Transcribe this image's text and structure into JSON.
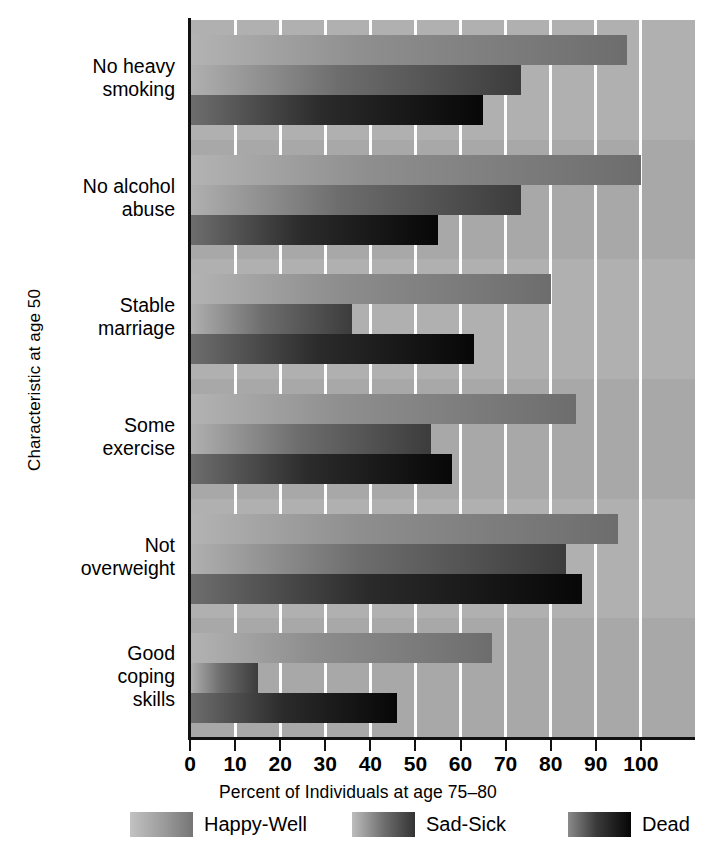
{
  "chart_data": {
    "type": "bar",
    "orientation": "horizontal",
    "title": "",
    "xlabel": "Percent of Individuals at age 75–80",
    "ylabel": "Characteristic at age 50",
    "categories": [
      "No heavy\nsmoking",
      "No alcohol\nabuse",
      "Stable\nmarriage",
      "Some\nexercise",
      "Not\noverweight",
      "Good\ncoping\nskills"
    ],
    "series": [
      {
        "name": "Happy-Well",
        "values": [
          97,
          100,
          80,
          85.5,
          95,
          67
        ]
      },
      {
        "name": "Sad-Sick",
        "values": [
          73.5,
          73.5,
          36,
          53.5,
          83.5,
          15
        ]
      },
      {
        "name": "Dead",
        "values": [
          65,
          55,
          63,
          58,
          87,
          46
        ]
      }
    ],
    "xlim": [
      0,
      112
    ],
    "xticks": [
      0,
      10,
      20,
      30,
      40,
      50,
      60,
      70,
      80,
      90,
      100
    ],
    "xticklabels": [
      "0",
      "10",
      "20",
      "30",
      "40",
      "50",
      "60",
      "70",
      "80",
      "90",
      "100"
    ],
    "grid": "vertical-white",
    "legend_position": "bottom",
    "colors": {
      "plot_background": "#a2a2a2",
      "band_background": "#b4b4b4",
      "gridline": "#fdfdfd",
      "axis": "#111111",
      "happy_well_start": "#b3b3b3",
      "happy_well_end": "#6d6d6d",
      "sad_sick_start": "#b0b0b0",
      "sad_sick_end": "#3c3c3c",
      "dead_start": "#6e6e6e",
      "dead_end": "#070707"
    }
  },
  "legend": {
    "items": [
      {
        "label": "Happy-Well",
        "swatch": "happy"
      },
      {
        "label": "Sad-Sick",
        "swatch": "sad"
      },
      {
        "label": "Dead",
        "swatch": "dead"
      }
    ]
  }
}
